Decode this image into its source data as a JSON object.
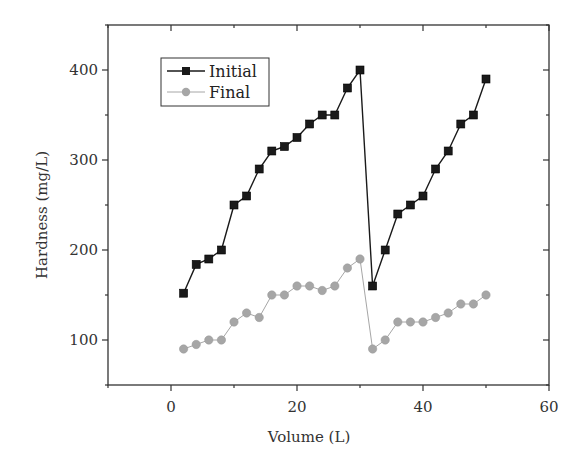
{
  "chart_data": {
    "type": "line",
    "title": "",
    "xlabel": "Volume (L)",
    "ylabel": "Hardness (mg/L)",
    "xlim": [
      -10,
      60
    ],
    "ylim": [
      50,
      450
    ],
    "xticks": [
      0,
      20,
      40,
      60
    ],
    "yticks": [
      100,
      200,
      300,
      400
    ],
    "grid": false,
    "legend_position": "upper-left",
    "x": [
      2,
      4,
      6,
      8,
      10,
      12,
      14,
      16,
      18,
      20,
      22,
      24,
      26,
      28,
      30,
      32,
      34,
      36,
      38,
      40,
      42,
      44,
      46,
      48,
      50
    ],
    "series": [
      {
        "name": "Initial",
        "marker": "square",
        "color": "#1a1a1a",
        "values": [
          152,
          184,
          190,
          200,
          250,
          260,
          290,
          310,
          315,
          325,
          340,
          350,
          350,
          380,
          400,
          160,
          200,
          240,
          250,
          260,
          290,
          310,
          340,
          350,
          390
        ]
      },
      {
        "name": "Final",
        "marker": "circle",
        "color": "#a6a6a6",
        "values": [
          90,
          95,
          100,
          100,
          120,
          130,
          125,
          150,
          150,
          160,
          160,
          155,
          160,
          180,
          190,
          90,
          100,
          120,
          120,
          120,
          125,
          130,
          140,
          140,
          150
        ]
      }
    ]
  }
}
